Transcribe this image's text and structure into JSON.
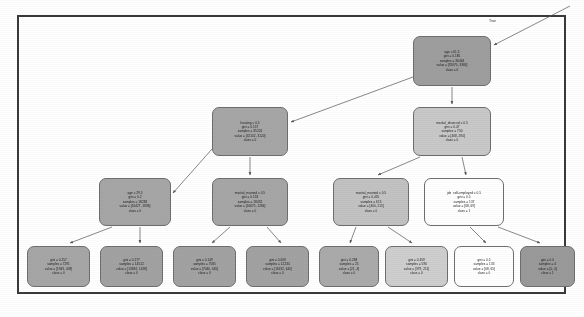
{
  "figure": {
    "type": "decision-tree-diagram",
    "title": "",
    "background_color": "#ffffff",
    "border_color": "#3a3a3a",
    "node_fill_dark": "#9e9e9e",
    "node_fill_mid": "#b0b0b0",
    "node_fill_light": "#e2e2e2",
    "node_fill_white": "#ffffff",
    "node_border_color": "#6e6e6e",
    "edge_color": "#555555"
  },
  "edge_labels": [
    {
      "text": "True",
      "x": 489,
      "y": 19
    }
  ],
  "nodes": [
    {
      "id": "root",
      "name": "node-root-age",
      "lines": [
        "age ≤ 61.5",
        "gini = 0.185",
        "samples = 36464",
        "value = [32670, 3384]",
        "class = 0"
      ],
      "x": 413,
      "y": 36,
      "w": 78,
      "h": 50,
      "fill": "#9e9e9e"
    },
    {
      "id": "housing",
      "name": "node-housing",
      "lines": [
        "housing ≤ 0.5",
        "gini = 0.157",
        "samples = 35202",
        "value = [32102, 3120]",
        "class = 0"
      ],
      "x": 212,
      "y": 107,
      "w": 76,
      "h": 49,
      "fill": "#a6a6a6"
    },
    {
      "id": "marital_divorced",
      "name": "node-marital-divorced",
      "lines": [
        "marital_divorced ≤ 0.5",
        "gini = 0.47",
        "samples = 750",
        "value = [468, 294]",
        "class = 0"
      ],
      "x": 413,
      "y": 107,
      "w": 78,
      "h": 49,
      "fill": "#c8c8c8"
    },
    {
      "id": "age29",
      "name": "node-age-29",
      "lines": [
        "age ≤ 29.5",
        "gini = 0.2",
        "samples = 18283",
        "value = [16427, 1836]",
        "class = 0"
      ],
      "x": 99,
      "y": 178,
      "w": 72,
      "h": 48,
      "fill": "#a6a6a6"
    },
    {
      "id": "marital_married_l",
      "name": "node-marital-married-left",
      "lines": [
        "marital_married ≤ 0.5",
        "gini = 0.153",
        "samples = 18032",
        "value = [16675, 1284]",
        "class = 0"
      ],
      "x": 212,
      "y": 178,
      "w": 76,
      "h": 48,
      "fill": "#a6a6a6"
    },
    {
      "id": "marital_married_r",
      "name": "node-marital-married-right",
      "lines": [
        "marital_married ≤ 0.5",
        "gini = 0.455",
        "samples = 615",
        "value = [400, 215]",
        "class = 0"
      ],
      "x": 333,
      "y": 178,
      "w": 76,
      "h": 48,
      "fill": "#c2c2c2"
    },
    {
      "id": "job_self",
      "name": "node-job-self-employed",
      "lines": [
        "job_self-employed ≤ 0.5",
        "gini = 0.5",
        "samples = 137",
        "value = [68, 69]",
        "class = 1"
      ],
      "x": 424,
      "y": 178,
      "w": 80,
      "h": 48,
      "fill": "#ffffff"
    }
  ],
  "leaves": [
    {
      "id": "leaf1",
      "name": "leaf-node-1",
      "lines": [
        "gini = 0.257",
        "samples = 7291",
        "value = [1943, 409]",
        "class = 0"
      ],
      "x": 27,
      "y": 246,
      "w": 63,
      "h": 41,
      "fill": "#a6a6a6"
    },
    {
      "id": "leaf2",
      "name": "leaf-node-2",
      "lines": [
        "gini = 0.177",
        "samples = 14512",
        "value = [13694, 1428]",
        "class = 0"
      ],
      "x": 100,
      "y": 246,
      "w": 63,
      "h": 41,
      "fill": "#a2a2a2"
    },
    {
      "id": "leaf3",
      "name": "leaf-node-3",
      "lines": [
        "gini = 0.149",
        "samples = 7585",
        "value = [7040, 645]",
        "class = 0"
      ],
      "x": 173,
      "y": 246,
      "w": 63,
      "h": 41,
      "fill": "#a2a2a2"
    },
    {
      "id": "leaf4",
      "name": "leaf-node-4",
      "lines": [
        "gini = 0.009",
        "samples = 12234",
        "value = [11632, 640]",
        "class = 0"
      ],
      "x": 246,
      "y": 246,
      "w": 63,
      "h": 41,
      "fill": "#a2a2a2"
    },
    {
      "id": "leaf5",
      "name": "leaf-node-5",
      "lines": [
        "gini = 0.268",
        "samples = 25",
        "value = [21, 4]",
        "class = 0"
      ],
      "x": 319,
      "y": 246,
      "w": 60,
      "h": 41,
      "fill": "#aaaaaa"
    },
    {
      "id": "leaf6",
      "name": "leaf-node-6",
      "lines": [
        "gini = 0.459",
        "samples = 590",
        "value = [379, 211]",
        "class = 0"
      ],
      "x": 385,
      "y": 246,
      "w": 63,
      "h": 41,
      "fill": "#cecece"
    },
    {
      "id": "leaf7",
      "name": "leaf-node-7",
      "lines": [
        "gini = 0.5",
        "samples = 133",
        "value = [68, 65]",
        "class = 0"
      ],
      "x": 454,
      "y": 246,
      "w": 60,
      "h": 41,
      "fill": "#ffffff"
    },
    {
      "id": "leaf8",
      "name": "leaf-node-8",
      "lines": [
        "gini = 0.0",
        "samples = 4",
        "value = [0, 4]",
        "class = 1"
      ],
      "x": 520,
      "y": 246,
      "w": 55,
      "h": 41,
      "fill": "#9a9a9a"
    }
  ]
}
